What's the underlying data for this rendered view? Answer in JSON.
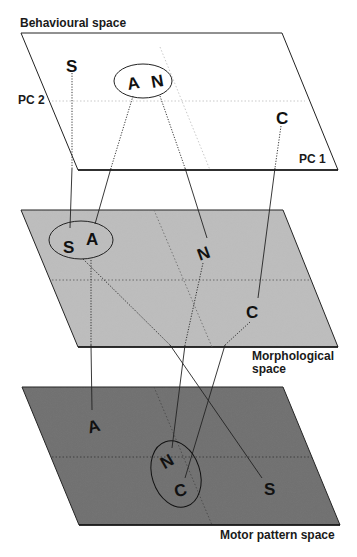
{
  "figure": {
    "planes": [
      {
        "id": "behavioural",
        "label": "Behavioural space",
        "fill": "#ffffff"
      },
      {
        "id": "morphological",
        "label_line1": "Morphological",
        "label_line2": "space",
        "fill": "#bdbdbd"
      },
      {
        "id": "motor",
        "label": "Motor pattern space",
        "fill": "#707070"
      }
    ],
    "axes": {
      "pc1": "PC 1",
      "pc2": "PC 2"
    },
    "points": {
      "behavioural": {
        "S": "S",
        "A": "A",
        "N": "N",
        "C": "C"
      },
      "morphological": {
        "S": "S",
        "A": "A",
        "N": "N",
        "C": "C"
      },
      "motor": {
        "A": "A",
        "N": "N",
        "C": "C",
        "S": "S"
      }
    },
    "groups": {
      "behavioural": [
        "A",
        "N"
      ],
      "morphological": [
        "S",
        "A"
      ],
      "motor": [
        "N",
        "C"
      ]
    }
  }
}
